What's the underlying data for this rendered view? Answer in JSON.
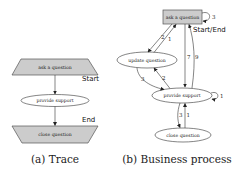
{
  "trace": {
    "caption": "(a) Trace",
    "nodes": {
      "start": "ask a question",
      "middle": "provide support",
      "end": "close question"
    },
    "annotations": {
      "start": "Start",
      "end": "End"
    }
  },
  "business_process": {
    "caption": "(b) Business process",
    "nodes": {
      "ask": "ask a question",
      "update": "update question",
      "provide": "provide support",
      "close": "close question"
    },
    "annotations": {
      "start_end": "Start/End"
    },
    "edges": [
      {
        "from": "ask a question",
        "to": "ask a question",
        "label": "3"
      },
      {
        "from": "ask a question",
        "to": "update question",
        "label": "2"
      },
      {
        "from": "update question",
        "to": "ask a question",
        "label": "1"
      },
      {
        "from": "ask a question",
        "to": "provide support",
        "label": "7"
      },
      {
        "from": "provide support",
        "to": "ask a question",
        "label": "9"
      },
      {
        "from": "update question",
        "to": "provide support",
        "label": "3"
      },
      {
        "from": "provide support",
        "to": "update question",
        "label": "2"
      },
      {
        "from": "provide support",
        "to": "provide support",
        "label": "1"
      },
      {
        "from": "provide support",
        "to": "close question",
        "label": "3"
      },
      {
        "from": "close question",
        "to": "provide support",
        "label": "1"
      }
    ]
  },
  "colors": {
    "node_fill": "#cccccc",
    "stroke": "#333333",
    "background": "#ffffff"
  }
}
